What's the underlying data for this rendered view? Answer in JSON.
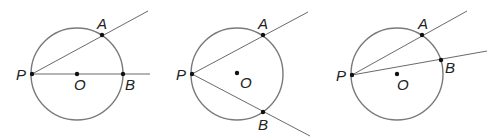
{
  "diagrams": [
    {
      "id": "diameter-case",
      "circle": {
        "cx": 77,
        "cy": 74,
        "r": 46
      },
      "points": {
        "P": {
          "x": 32,
          "y": 74,
          "label": "P",
          "lx": 16,
          "ly": 80
        },
        "O": {
          "x": 77,
          "y": 74,
          "label": "O",
          "lx": 74,
          "ly": 90
        },
        "A": {
          "x": 102,
          "y": 35,
          "label": "A",
          "lx": 97,
          "ly": 29
        },
        "B": {
          "x": 123,
          "y": 74,
          "label": "B",
          "lx": 125,
          "ly": 90
        }
      },
      "rays": [
        {
          "from": "P",
          "x2": 148,
          "y2": 11
        },
        {
          "from": "P",
          "x2": 150,
          "y2": 74
        }
      ]
    },
    {
      "id": "center-inside-case",
      "circle": {
        "cx": 237,
        "cy": 74,
        "r": 46
      },
      "points": {
        "P": {
          "x": 192,
          "y": 74,
          "label": "P",
          "lx": 176,
          "ly": 80
        },
        "O": {
          "x": 237,
          "y": 73,
          "label": "O",
          "lx": 240,
          "ly": 88
        },
        "A": {
          "x": 263,
          "y": 35,
          "label": "A",
          "lx": 258,
          "ly": 29
        },
        "B": {
          "x": 263,
          "y": 112,
          "label": "B",
          "lx": 258,
          "ly": 130
        }
      },
      "rays": [
        {
          "from": "P",
          "x2": 308,
          "y2": 12
        },
        {
          "from": "P",
          "x2": 310,
          "y2": 136
        }
      ]
    },
    {
      "id": "center-outside-case",
      "circle": {
        "cx": 397,
        "cy": 74,
        "r": 46
      },
      "points": {
        "P": {
          "x": 352,
          "y": 75,
          "label": "P",
          "lx": 336,
          "ly": 81
        },
        "O": {
          "x": 397,
          "y": 74,
          "label": "O",
          "lx": 397,
          "ly": 90
        },
        "A": {
          "x": 422,
          "y": 35,
          "label": "A",
          "lx": 418,
          "ly": 29
        },
        "B": {
          "x": 441,
          "y": 60,
          "label": "B",
          "lx": 445,
          "ly": 73
        }
      },
      "rays": [
        {
          "from": "P",
          "x2": 467,
          "y2": 11
        },
        {
          "from": "P",
          "x2": 487,
          "y2": 51
        }
      ]
    }
  ],
  "colors": {
    "circle": "#7a7a7a",
    "line": "#6a6a6a",
    "point": "#111111",
    "label": "#222222"
  }
}
